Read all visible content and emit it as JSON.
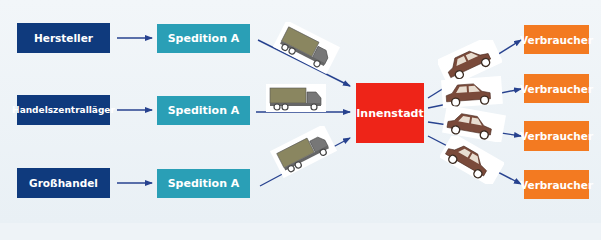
{
  "diagram": {
    "sources": [
      {
        "label": "Hersteller"
      },
      {
        "label": "Handelszentralläger"
      },
      {
        "label": "Großhandel"
      }
    ],
    "forwarders": [
      {
        "label": "Spedition A"
      },
      {
        "label": "Spedition A"
      },
      {
        "label": "Spedition A"
      }
    ],
    "hub": {
      "label": "Innenstadt"
    },
    "consumers": [
      {
        "label": "Verbraucher"
      },
      {
        "label": "Verbraucher"
      },
      {
        "label": "Verbraucher"
      },
      {
        "label": "Verbraucher"
      }
    ],
    "icons": {
      "inbound_vehicle": "truck-icon",
      "outbound_vehicle": "car-icon"
    },
    "colors": {
      "source": "#0f3a7d",
      "forwarder": "#2a9fb6",
      "hub": "#ee2418",
      "consumer": "#f37a21",
      "arrow": "#27428f",
      "truck": "#8a8660",
      "car": "#7a4a3a"
    }
  }
}
